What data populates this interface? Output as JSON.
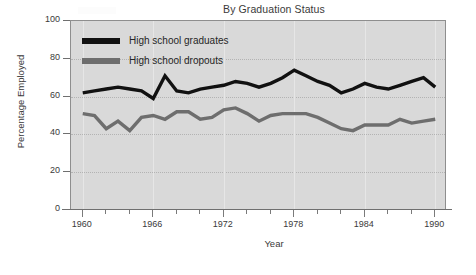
{
  "chart_data": {
    "type": "line",
    "title": "By Graduation Status",
    "xlabel": "Year",
    "ylabel": "Percentage Employed",
    "xlim": [
      1959,
      1991
    ],
    "ylim": [
      0,
      100
    ],
    "grid": "horizontal-dotted",
    "legend_position": "top-left-inside",
    "y_ticks": [
      0,
      20,
      40,
      60,
      80,
      100
    ],
    "x_ticks": [
      1960,
      1966,
      1972,
      1978,
      1984,
      1990
    ],
    "x_minor_tick_interval": 2,
    "x": [
      1960,
      1961,
      1962,
      1963,
      1964,
      1965,
      1966,
      1967,
      1968,
      1969,
      1970,
      1971,
      1972,
      1973,
      1974,
      1975,
      1976,
      1977,
      1978,
      1979,
      1980,
      1981,
      1982,
      1983,
      1984,
      1985,
      1986,
      1987,
      1988,
      1989,
      1990
    ],
    "series": [
      {
        "name": "High school graduates",
        "color": "#111111",
        "values": [
          62,
          63,
          64,
          65,
          64,
          63,
          59,
          71,
          63,
          62,
          64,
          65,
          66,
          68,
          67,
          65,
          67,
          70,
          74,
          71,
          68,
          66,
          62,
          64,
          67,
          65,
          64,
          66,
          68,
          70,
          65
        ]
      },
      {
        "name": "High school dropouts",
        "color": "#6e6e6e",
        "values": [
          51,
          50,
          43,
          47,
          42,
          49,
          50,
          48,
          52,
          52,
          48,
          49,
          53,
          54,
          51,
          47,
          50,
          51,
          51,
          51,
          49,
          46,
          43,
          42,
          45,
          45,
          45,
          48,
          46,
          47,
          48
        ]
      }
    ]
  },
  "legend": {
    "items": [
      {
        "label": "High school graduates",
        "color": "#111111"
      },
      {
        "label": "High school dropouts",
        "color": "#6e6e6e"
      }
    ]
  },
  "axes": {
    "y_tick_labels": [
      "100",
      "80",
      "60",
      "40",
      "20",
      "0"
    ],
    "x_tick_labels": [
      "1960",
      "1966",
      "1972",
      "1978",
      "1984",
      "1990"
    ]
  }
}
